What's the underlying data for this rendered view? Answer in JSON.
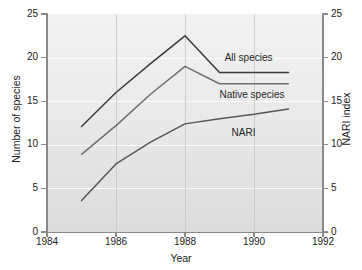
{
  "chart_data": {
    "type": "line",
    "title": "",
    "xlabel": "Year",
    "ylabel": "Number of species",
    "ylabel_right": "NARI index",
    "xlim": [
      1984,
      1992
    ],
    "ylim": [
      0,
      25
    ],
    "ylim_right": [
      0,
      25
    ],
    "xticks": [
      1984,
      1986,
      1988,
      1990,
      1992
    ],
    "yticks": [
      0,
      5,
      10,
      15,
      20,
      25
    ],
    "yticks_right": [
      0,
      5,
      10,
      15,
      20,
      25
    ],
    "grid": true,
    "legend_position": "inline-labels",
    "x": [
      1985,
      1986,
      1987,
      1988,
      1989,
      1990,
      1991
    ],
    "series": [
      {
        "name": "All species",
        "color": "#3a3a3a",
        "values": [
          12.1,
          16.0,
          19.3,
          22.5,
          18.3,
          18.3,
          18.3
        ],
        "label_x": 1989.15,
        "label_y": 19.9
      },
      {
        "name": "Native species",
        "color": "#6e6e6e",
        "values": [
          8.9,
          12.2,
          15.8,
          19.0,
          17.0,
          17.0,
          17.0
        ],
        "label_x": 1989.0,
        "label_y": 15.6
      },
      {
        "name": "NARI",
        "color": "#555555",
        "values": [
          3.6,
          7.8,
          10.3,
          12.4,
          13.0,
          13.5,
          14.1
        ],
        "label_x": 1989.35,
        "label_y": 11.3
      }
    ]
  },
  "axes": {
    "x_tick_labels": [
      "1984",
      "1986",
      "1988",
      "1990",
      "1992"
    ],
    "y_tick_labels_left": [
      "0",
      "5",
      "10",
      "15",
      "20",
      "25"
    ],
    "y_tick_labels_right": [
      "0",
      "5",
      "10",
      "15",
      "20",
      "25"
    ],
    "x_title": "Year",
    "y_title_left": "Number of species",
    "y_title_right": "NARI index"
  },
  "labels": {
    "all_species": "All species",
    "native_species": "Native species",
    "nari": "NARI"
  }
}
